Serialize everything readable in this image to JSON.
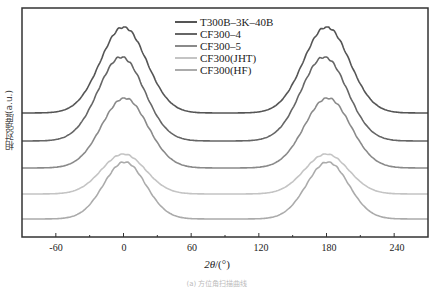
{
  "chart_data": {
    "type": "line",
    "title": "",
    "xlabel": "2θ/(°)",
    "ylabel": "相对强度(a.u.)",
    "xlim": [
      -90,
      270
    ],
    "xticks": [
      -60,
      0,
      60,
      120,
      180,
      240
    ],
    "yticks": [],
    "grid": false,
    "legend_position": "upper center",
    "series": [
      {
        "name": "T300B–3K–40B",
        "color": "#555555",
        "baseline_px": 113,
        "peak_px": 27,
        "peak_positions": [
          0,
          180
        ],
        "fwhm_deg": 48
      },
      {
        "name": "CF300–4",
        "color": "#666666",
        "baseline_px": 141,
        "peak_px": 57,
        "peak_positions": [
          -2,
          178
        ],
        "fwhm_deg": 48
      },
      {
        "name": "CF300–5",
        "color": "#8a8a8a",
        "baseline_px": 168,
        "peak_px": 98,
        "peak_positions": [
          1,
          181
        ],
        "fwhm_deg": 48
      },
      {
        "name": "CF300(JHT)",
        "color": "#c4c4c4",
        "baseline_px": 194,
        "peak_px": 154,
        "peak_positions": [
          0,
          180
        ],
        "fwhm_deg": 46
      },
      {
        "name": "CF300(HF)",
        "color": "#ababab",
        "baseline_px": 219,
        "peak_px": 162,
        "peak_positions": [
          1,
          181
        ],
        "fwhm_deg": 44
      }
    ]
  },
  "labels": {
    "xlabel": "2θ/(°)",
    "ylabel": "相对强度(a.u.)",
    "caption": "(a) 方位角扫描曲线"
  },
  "ticks": [
    "-60",
    "0",
    "60",
    "120",
    "180",
    "240"
  ],
  "legend": [
    "T300B–3K–40B",
    "CF300–4",
    "CF300–5",
    "CF300(JHT)",
    "CF300(HF)"
  ]
}
